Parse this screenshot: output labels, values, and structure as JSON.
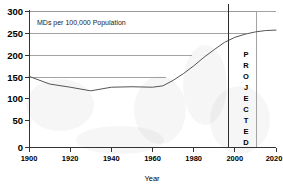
{
  "chart_data": {
    "type": "line",
    "title": "",
    "annotation": "MDs per 100,000 Population",
    "xlabel": "Year",
    "ylabel": "",
    "xlim": [
      1900,
      2020
    ],
    "ylim": [
      0,
      300
    ],
    "xticks": [
      1900,
      1920,
      1940,
      1960,
      1980,
      2000,
      2020
    ],
    "yticks": [
      0,
      50,
      100,
      150,
      200,
      250,
      300
    ],
    "grid": true,
    "legend": "none",
    "series": [
      {
        "name": "MDs per 100,000 Population",
        "x": [
          1900,
          1910,
          1920,
          1930,
          1940,
          1950,
          1960,
          1965,
          1970,
          1975,
          1980,
          1985,
          1990,
          1995,
          2000,
          2005,
          2010,
          2015,
          2020
        ],
        "values": [
          157,
          140,
          133,
          125,
          133,
          134,
          133,
          136,
          148,
          163,
          180,
          199,
          216,
          232,
          243,
          250,
          255,
          258,
          259
        ]
      }
    ],
    "projection": {
      "label": "PROJECTED",
      "letters": [
        "P",
        "R",
        "O",
        "J",
        "E",
        "C",
        "T",
        "E",
        "D"
      ],
      "start_year": 1997
    }
  },
  "axis": {
    "y_labels": [
      "300",
      "250",
      "200",
      "150",
      "100",
      "50",
      "0"
    ],
    "x_labels": [
      "1900",
      "1920",
      "1940",
      "1960",
      "1980",
      "2000",
      "2020"
    ],
    "x_title": "Year"
  },
  "annotations": {
    "series_caption": "MDs per 100,000 Population"
  }
}
